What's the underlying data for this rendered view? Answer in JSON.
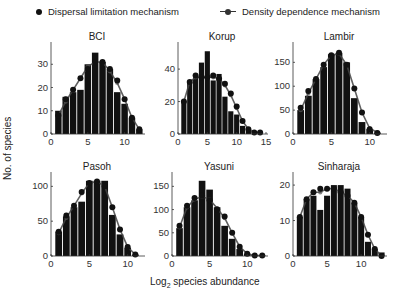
{
  "legend": {
    "dispersal": "Dispersal limitation mechanism",
    "density": "Density dependence mechanism"
  },
  "axis": {
    "ylabel": "No. of species",
    "xlabel_prefix": "Log",
    "xlabel_sub": "2",
    "xlabel_suffix": " species abundance"
  },
  "chart_data": [
    {
      "type": "bar",
      "title": "BCI",
      "xlabel": "Log2 species abundance",
      "ylabel": "No. of species",
      "x": [
        1,
        2,
        3,
        4,
        5,
        6,
        7,
        8,
        9,
        10,
        11,
        12
      ],
      "series": [
        {
          "name": "Observed (bars)",
          "values": [
            10,
            16,
            18,
            19,
            30,
            35,
            31,
            28,
            18,
            13,
            7,
            2
          ]
        },
        {
          "name": "Dispersal limitation mechanism",
          "values": [
            8,
            15,
            19,
            24,
            28,
            31,
            31,
            28,
            23,
            15,
            7,
            2
          ]
        },
        {
          "name": "Density dependence mechanism",
          "values": [
            8,
            14,
            19,
            24,
            29,
            31,
            31,
            27,
            22,
            15,
            7,
            2
          ]
        }
      ],
      "xlim": [
        0,
        12.5
      ],
      "ylim": [
        0,
        37
      ],
      "xticks": [
        0,
        5,
        10
      ],
      "yticks": [
        0,
        10,
        20,
        30
      ]
    },
    {
      "type": "bar",
      "title": "Korup",
      "xlabel": "Log2 species abundance",
      "ylabel": "No. of species",
      "x": [
        1,
        2,
        3,
        4,
        5,
        6,
        7,
        8,
        9,
        10,
        11,
        12,
        13,
        14
      ],
      "series": [
        {
          "name": "Observed (bars)",
          "values": [
            20,
            32,
            35,
            44,
            51,
            33,
            37,
            23,
            14,
            12,
            5,
            2,
            0,
            0
          ]
        },
        {
          "name": "Dispersal limitation mechanism",
          "values": [
            20,
            32,
            36,
            35,
            35,
            36,
            34,
            31,
            25,
            17,
            8,
            3,
            1,
            1
          ]
        },
        {
          "name": "Density dependence mechanism",
          "values": [
            20,
            32,
            35,
            35,
            35,
            35,
            34,
            30,
            24,
            16,
            8,
            3,
            1,
            1
          ]
        }
      ],
      "xlim": [
        0,
        15
      ],
      "ylim": [
        0,
        53
      ],
      "xticks": [
        0,
        5,
        10,
        15
      ],
      "yticks": [
        0,
        20,
        40
      ]
    },
    {
      "type": "bar",
      "title": "Lambir",
      "xlabel": "Log2 species abundance",
      "ylabel": "No. of species",
      "x": [
        1,
        2,
        3,
        4,
        5,
        6,
        7,
        8,
        9,
        10,
        11
      ],
      "series": [
        {
          "name": "Observed (bars)",
          "values": [
            50,
            80,
            115,
            140,
            167,
            170,
            150,
            75,
            25,
            10,
            3
          ]
        },
        {
          "name": "Dispersal limitation mechanism",
          "values": [
            55,
            90,
            115,
            145,
            165,
            170,
            145,
            95,
            45,
            10,
            2
          ]
        },
        {
          "name": "Density dependence mechanism",
          "values": [
            50,
            85,
            115,
            145,
            165,
            168,
            145,
            95,
            45,
            12,
            3
          ]
        }
      ],
      "xlim": [
        0,
        12
      ],
      "ylim": [
        0,
        180
      ],
      "xticks": [
        0,
        5,
        10
      ],
      "yticks": [
        0,
        50,
        100,
        150
      ]
    },
    {
      "type": "bar",
      "title": "Pasoh",
      "xlabel": "Log2 species abundance",
      "ylabel": "No. of species",
      "x": [
        1,
        2,
        3,
        4,
        5,
        6,
        7,
        8,
        9,
        10,
        11
      ],
      "series": [
        {
          "name": "Observed (bars)",
          "values": [
            35,
            57,
            70,
            78,
            108,
            108,
            108,
            59,
            31,
            12,
            2
          ]
        },
        {
          "name": "Dispersal limitation mechanism",
          "values": [
            35,
            58,
            72,
            92,
            105,
            107,
            100,
            70,
            38,
            13,
            2
          ]
        },
        {
          "name": "Density dependence mechanism",
          "values": [
            33,
            55,
            72,
            90,
            105,
            107,
            100,
            70,
            38,
            13,
            2
          ]
        }
      ],
      "xlim": [
        0,
        12
      ],
      "ylim": [
        0,
        112
      ],
      "xticks": [
        0,
        5,
        10
      ],
      "yticks": [
        0,
        50,
        100
      ]
    },
    {
      "type": "bar",
      "title": "Yasuni",
      "xlabel": "Log2 species abundance",
      "ylabel": "No. of species",
      "x": [
        1,
        2,
        3,
        4,
        5,
        6,
        7,
        8,
        9,
        10,
        11,
        12
      ],
      "series": [
        {
          "name": "Observed (bars)",
          "values": [
            60,
            105,
            120,
            162,
            143,
            105,
            65,
            37,
            15,
            5,
            2,
            1
          ]
        },
        {
          "name": "Dispersal limitation mechanism",
          "values": [
            65,
            108,
            125,
            130,
            120,
            100,
            85,
            50,
            20,
            5,
            1,
            1
          ]
        },
        {
          "name": "Density dependence mechanism",
          "values": [
            62,
            105,
            122,
            128,
            122,
            103,
            82,
            50,
            20,
            5,
            1,
            1
          ]
        }
      ],
      "xlim": [
        0,
        12.5
      ],
      "ylim": [
        0,
        168
      ],
      "xticks": [
        0,
        5,
        10
      ],
      "yticks": [
        0,
        50,
        100,
        150
      ]
    },
    {
      "type": "bar",
      "title": "Sinharaja",
      "xlabel": "Log2 species abundance",
      "ylabel": "No. of species",
      "x": [
        1,
        2,
        3,
        4,
        5,
        6,
        7,
        8,
        9,
        10,
        11,
        12,
        13
      ],
      "series": [
        {
          "name": "Observed (bars)",
          "values": [
            11,
            16,
            17,
            13,
            17,
            20,
            20,
            19,
            15,
            11,
            4,
            2,
            1
          ]
        },
        {
          "name": "Dispersal limitation mechanism",
          "values": [
            11,
            16,
            18,
            19,
            19,
            19,
            18,
            17,
            15,
            11,
            6,
            2,
            0
          ]
        },
        {
          "name": "Density dependence mechanism",
          "values": [
            11,
            16,
            18,
            18,
            19,
            19,
            18,
            17,
            15,
            11,
            6,
            2,
            0
          ]
        }
      ],
      "xlim": [
        0,
        13.5
      ],
      "ylim": [
        0,
        22
      ],
      "xticks": [
        0,
        5,
        10
      ],
      "yticks": [
        0,
        10,
        20
      ]
    }
  ],
  "colors": {
    "bar": "#111111",
    "dot": "#111111",
    "line": "#444444",
    "axis": "#333333"
  }
}
